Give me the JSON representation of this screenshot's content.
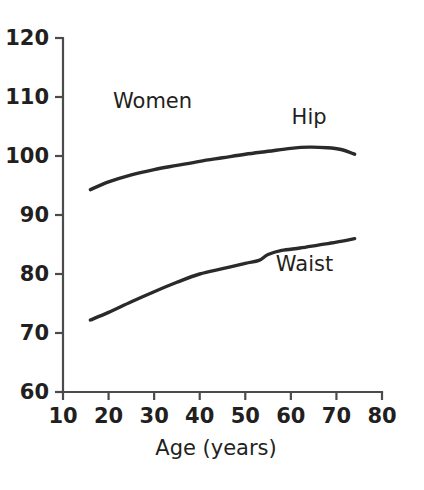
{
  "chart_data": {
    "type": "line",
    "title": "",
    "group_label": "Women",
    "xlabel": "Age (years)",
    "ylabel": "",
    "xlim": [
      10,
      80
    ],
    "ylim": [
      60,
      120
    ],
    "xticks": [
      10,
      20,
      30,
      40,
      50,
      60,
      70,
      80
    ],
    "yticks": [
      60,
      70,
      80,
      90,
      100,
      110,
      120
    ],
    "xtick_labels": [
      "10",
      "20",
      "30",
      "40",
      "50",
      "60",
      "70",
      "80"
    ],
    "ytick_labels": [
      "60",
      "70",
      "80",
      "90",
      "100",
      "110",
      "120"
    ],
    "grid": false,
    "legend_position": "inline-annotations",
    "line_color": "#2a2a2a",
    "axis_color": "#4b4b4b",
    "background_color": "#ffffff",
    "series": [
      {
        "name": "Hip",
        "label": "Hip",
        "label_x": 64,
        "label_y": 105.5,
        "x": [
          16,
          20,
          25,
          30,
          35,
          40,
          45,
          50,
          55,
          60,
          64,
          68,
          71,
          74
        ],
        "values": [
          94.3,
          95.6,
          96.8,
          97.7,
          98.4,
          99.1,
          99.7,
          100.3,
          100.8,
          101.3,
          101.5,
          101.4,
          101.1,
          100.3
        ]
      },
      {
        "name": "Waist",
        "label": "Waist",
        "label_x": 63,
        "label_y": 80.5,
        "x": [
          16,
          20,
          25,
          30,
          35,
          40,
          45,
          50,
          53,
          55,
          58,
          62,
          66,
          70,
          74
        ],
        "values": [
          72.2,
          73.5,
          75.3,
          77.0,
          78.6,
          80.0,
          80.9,
          81.8,
          82.3,
          83.3,
          84.0,
          84.4,
          84.9,
          85.4,
          86.0
        ]
      }
    ]
  },
  "axis": {
    "x_title": "Age (years)",
    "y_title": ""
  }
}
